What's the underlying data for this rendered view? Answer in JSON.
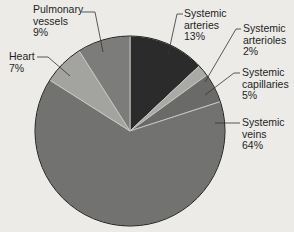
{
  "chart_data": {
    "type": "pie",
    "title": "",
    "start_angle_deg": 0,
    "direction": "clockwise",
    "slices": [
      {
        "name": "Systemic arteries",
        "line1": "Systemic",
        "line2": "arteries",
        "value": 13,
        "pct_label": "13%",
        "color": "#2b2b2b"
      },
      {
        "name": "Systemic arterioles",
        "line1": "Systemic",
        "line2": "arterioles",
        "value": 2,
        "pct_label": "2%",
        "color": "#a9a9a6"
      },
      {
        "name": "Systemic capillaries",
        "line1": "Systemic",
        "line2": "capillaries",
        "value": 5,
        "pct_label": "5%",
        "color": "#6a6a68"
      },
      {
        "name": "Systemic veins",
        "line1": "Systemic",
        "line2": "veins",
        "value": 64,
        "pct_label": "64%",
        "color": "#727270"
      },
      {
        "name": "Heart",
        "line1": "Heart",
        "line2": "",
        "value": 7,
        "pct_label": "7%",
        "color": "#a3a3a0"
      },
      {
        "name": "Pulmonary vessels",
        "line1": "Pulmonary",
        "line2": "vessels",
        "value": 9,
        "pct_label": "9%",
        "color": "#7c7c7a"
      }
    ],
    "categories": [
      "Systemic arteries",
      "Systemic arterioles",
      "Systemic capillaries",
      "Systemic veins",
      "Heart",
      "Pulmonary vessels"
    ],
    "values": [
      13,
      2,
      5,
      64,
      7,
      9
    ],
    "legend": "none (leader-line labels)"
  }
}
